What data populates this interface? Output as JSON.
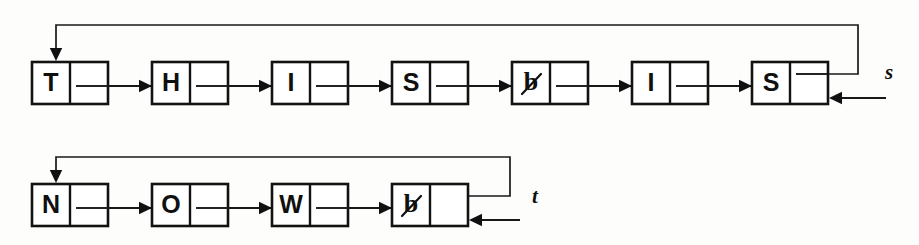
{
  "figure": {
    "background_color": "#fdfdfc",
    "ink_color": "#111111",
    "width": 919,
    "height": 245
  },
  "lists": [
    {
      "id": "list-s",
      "pointer_label": "s",
      "string_value": "THIS IS",
      "node_count": 7,
      "circular": true,
      "row": 1,
      "nodes": [
        {
          "index": 0,
          "char": "T",
          "is_blank": false
        },
        {
          "index": 1,
          "char": "H",
          "is_blank": false
        },
        {
          "index": 2,
          "char": "I",
          "is_blank": false
        },
        {
          "index": 3,
          "char": "S",
          "is_blank": false
        },
        {
          "index": 4,
          "char": "b",
          "is_blank": true
        },
        {
          "index": 5,
          "char": "I",
          "is_blank": false
        },
        {
          "index": 6,
          "char": "S",
          "is_blank": false
        }
      ]
    },
    {
      "id": "list-t",
      "pointer_label": "t",
      "string_value": "NOW",
      "node_count": 4,
      "circular": true,
      "row": 2,
      "nodes": [
        {
          "index": 0,
          "char": "N",
          "is_blank": false
        },
        {
          "index": 1,
          "char": "O",
          "is_blank": false
        },
        {
          "index": 2,
          "char": "W",
          "is_blank": false
        },
        {
          "index": 3,
          "char": "b",
          "is_blank": true
        }
      ]
    }
  ],
  "legend": {
    "blank_symbol_name": "slashed-b-blank-character",
    "blank_meaning": "blank / space character"
  }
}
